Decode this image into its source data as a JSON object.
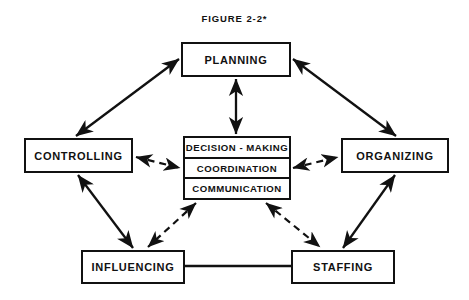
{
  "figure": {
    "title": "FIGURE  2-2*"
  },
  "colors": {
    "ink": "#111111",
    "paper": "#ffffff"
  },
  "nodes": {
    "planning": "PLANNING",
    "controlling": "CONTROLLING",
    "organizing": "ORGANIZING",
    "influencing": "INFLUENCING",
    "staffing": "STAFFING"
  },
  "center_stack": {
    "rows": [
      "DECISION - MAKING",
      "COORDINATION",
      "COMMUNICATION"
    ]
  },
  "connections": [
    {
      "from": "CONTROLLING",
      "to": "PLANNING",
      "style": "solid",
      "arrows": "both"
    },
    {
      "from": "PLANNING",
      "to": "ORGANIZING",
      "style": "solid",
      "arrows": "both"
    },
    {
      "from": "PLANNING",
      "to": "DECISION - MAKING",
      "style": "solid",
      "arrows": "both"
    },
    {
      "from": "CONTROLLING",
      "to": "INFLUENCING",
      "style": "solid",
      "arrows": "both"
    },
    {
      "from": "ORGANIZING",
      "to": "STAFFING",
      "style": "solid",
      "arrows": "both"
    },
    {
      "from": "INFLUENCING",
      "to": "STAFFING",
      "style": "solid",
      "arrows": "none"
    },
    {
      "from": "CONTROLLING",
      "to": "COORDINATION",
      "style": "dashed",
      "arrows": "both"
    },
    {
      "from": "COORDINATION",
      "to": "ORGANIZING",
      "style": "dashed",
      "arrows": "both"
    },
    {
      "from": "COMMUNICATION",
      "to": "INFLUENCING",
      "style": "dashed",
      "arrows": "both"
    },
    {
      "from": "COMMUNICATION",
      "to": "STAFFING",
      "style": "dashed",
      "arrows": "both"
    }
  ]
}
